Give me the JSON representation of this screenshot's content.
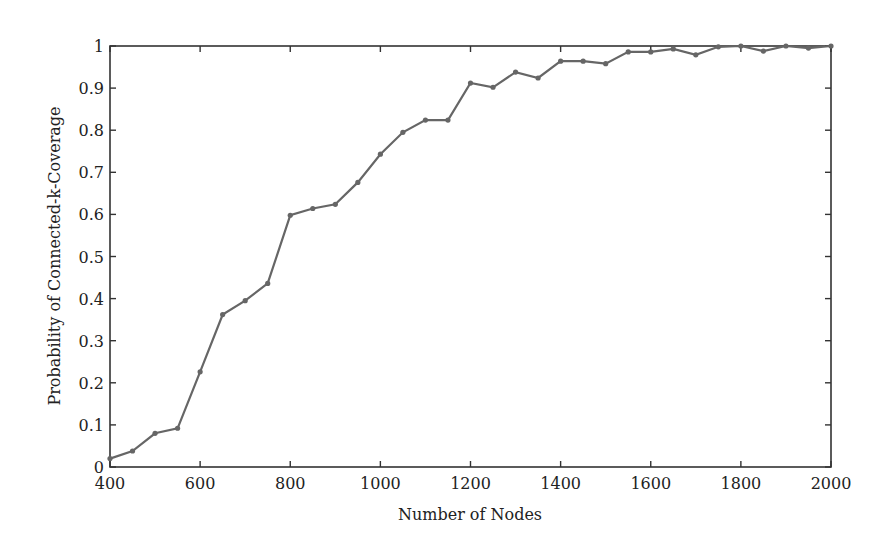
{
  "chart_data": {
    "type": "line",
    "title": "",
    "xlabel": "Number of Nodes",
    "ylabel": "Probability of Connected-k-Coverage",
    "xlim": [
      400,
      2000
    ],
    "ylim": [
      0,
      1
    ],
    "xticks": [
      400,
      600,
      800,
      1000,
      1200,
      1400,
      1600,
      1800,
      2000
    ],
    "yticks": [
      0,
      0.1,
      0.2,
      0.3,
      0.4,
      0.5,
      0.6,
      0.7,
      0.8,
      0.9,
      1
    ],
    "ytick_labels": [
      "0",
      "0.1",
      "0.2",
      "0.3",
      "0.4",
      "0.5",
      "0.6",
      "0.7",
      "0.8",
      "0.9",
      "1"
    ],
    "grid": false,
    "legend": null,
    "series": [
      {
        "name": "Probability",
        "color": "#666666",
        "marker": "dot",
        "x": [
          400,
          450,
          500,
          550,
          600,
          650,
          700,
          750,
          800,
          850,
          900,
          950,
          1000,
          1050,
          1100,
          1150,
          1200,
          1250,
          1300,
          1350,
          1400,
          1450,
          1500,
          1550,
          1600,
          1650,
          1700,
          1750,
          1800,
          1850,
          1900,
          1950,
          2000
        ],
        "values": [
          0.02,
          0.038,
          0.08,
          0.092,
          0.226,
          0.362,
          0.395,
          0.436,
          0.598,
          0.614,
          0.624,
          0.676,
          0.743,
          0.795,
          0.824,
          0.824,
          0.912,
          0.902,
          0.938,
          0.924,
          0.964,
          0.964,
          0.958,
          0.986,
          0.986,
          0.993,
          0.979,
          0.998,
          1.0,
          0.988,
          1.0,
          0.995,
          1.0
        ]
      }
    ]
  }
}
